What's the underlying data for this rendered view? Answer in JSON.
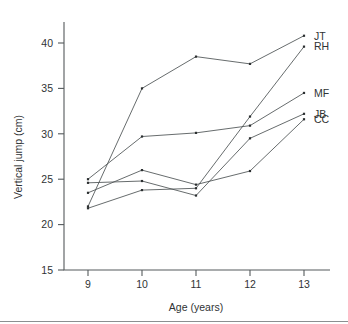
{
  "chart_data": {
    "type": "line",
    "title": "",
    "subtitle": "",
    "xlabel": "Age (years)",
    "ylabel": "Vertical jump (cm)",
    "x": [
      9,
      10,
      11,
      12,
      13
    ],
    "categories": [
      "9",
      "10",
      "11",
      "12",
      "13"
    ],
    "xtick_labels": [
      "9",
      "10",
      "11",
      "12",
      "13"
    ],
    "ytick_labels": [
      "15",
      "20",
      "25",
      "30",
      "35",
      "40"
    ],
    "yticks": [
      15,
      20,
      25,
      30,
      35,
      40
    ],
    "xlim": [
      8.6,
      13.15
    ],
    "ylim": [
      15,
      42.3
    ],
    "grid": false,
    "legend_position": "right-inline-end-of-line",
    "marker": "point",
    "line_color": "#4c5153",
    "marker_color": "#2b2f30",
    "axis_color": "#555a5c",
    "text_color": "#2f3334",
    "background": "#ffffff",
    "series": [
      {
        "name": "JT",
        "label": "JT",
        "values": [
          22.0,
          35.0,
          38.5,
          37.7,
          40.8
        ]
      },
      {
        "name": "RH",
        "label": "RH",
        "values": [
          21.8,
          23.8,
          24.0,
          31.9,
          39.6
        ]
      },
      {
        "name": "MF",
        "label": "MF",
        "values": [
          25.0,
          29.7,
          30.1,
          30.9,
          34.5
        ]
      },
      {
        "name": "JB",
        "label": "JB",
        "values": [
          24.6,
          24.8,
          23.2,
          29.5,
          32.2
        ]
      },
      {
        "name": "CC",
        "label": "CC",
        "values": [
          23.5,
          26.0,
          24.4,
          25.9,
          31.6
        ]
      }
    ]
  }
}
